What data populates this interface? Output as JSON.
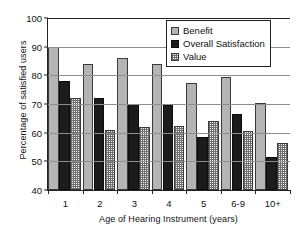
{
  "chart_data": {
    "type": "bar",
    "title": "",
    "xlabel": "Age of Hearing Instrument (years)",
    "ylabel": "Percentage of satisfied users",
    "categories": [
      "1",
      "2",
      "3",
      "4",
      "5",
      "6-9",
      "10+"
    ],
    "series": [
      {
        "name": "Benefit",
        "values": [
          90,
          84,
          86,
          84,
          77.5,
          79.5,
          70.5
        ],
        "color": "#b4b4b4"
      },
      {
        "name": "Overall Satisfaction",
        "values": [
          78,
          72,
          70,
          69.5,
          58.5,
          66.5,
          51.5
        ],
        "color": "#1c1c1c"
      },
      {
        "name": "Value",
        "values": [
          72,
          61,
          62,
          62.5,
          64,
          60.5,
          56.5
        ],
        "color": "#f2f2f2"
      }
    ],
    "ylim": [
      40,
      100
    ],
    "yticks": [
      40,
      50,
      60,
      70,
      80,
      90,
      100
    ],
    "ytick_labels": [
      "40",
      "50",
      "60",
      "70",
      "80",
      "90",
      "100"
    ],
    "grid": true,
    "grid_axis": "y",
    "legend_position": "top-right",
    "legend_entries": [
      "Benefit",
      "Overall Satisfaction",
      "Value"
    ]
  }
}
